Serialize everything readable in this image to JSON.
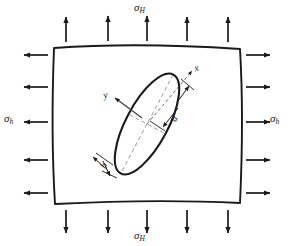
{
  "figure": {
    "type": "mechanics-diagram",
    "background_color": "#ffffff",
    "line_color": "#1a1a1a",
    "guide_color": "#8c8c8c"
  },
  "stresses": {
    "vertical": {
      "symbol": "σ",
      "subscript": "H",
      "name": "sigma-H",
      "top_label": "σ",
      "bottom_label": "σ",
      "arrow_count_top": 5,
      "arrow_count_bottom": 5,
      "direction": "outward"
    },
    "horizontal": {
      "symbol": "σ",
      "subscript": "h",
      "name": "sigma-h",
      "left_label": "σ",
      "right_label": "σ",
      "arrow_count_left": 5,
      "arrow_count_right": 5,
      "direction": "outward"
    }
  },
  "block": {
    "name": "rock-block",
    "shape": "slightly-distorted-square"
  },
  "flaw": {
    "name": "elliptical-flaw",
    "shape": "ellipse",
    "inclination_deg": 62,
    "semi_major_label": "a",
    "semi_minor_label": "b"
  },
  "axes": {
    "x_label": "x",
    "y_label": "y"
  }
}
